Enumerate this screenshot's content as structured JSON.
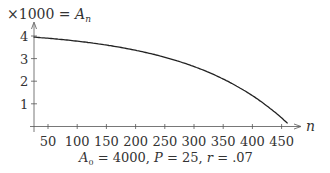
{
  "chart_data": {
    "type": "line",
    "ylabel_prefix": "×1000 = ",
    "ylabel_var": "A",
    "ylabel_sub": "n",
    "xlabel": "n",
    "caption": {
      "a0_var": "A",
      "a0_sub": "0",
      "a0_value": " = 4000, ",
      "p_var": "P",
      "p_value": " = 25, ",
      "r_var": "r",
      "r_value": " = .07"
    },
    "x_ticks": [
      "50",
      "100",
      "150",
      "200",
      "250",
      "300",
      "350",
      "400",
      "450"
    ],
    "y_ticks": [
      "1",
      "2",
      "3",
      "4"
    ],
    "xlim": [
      25,
      490
    ],
    "ylim": [
      0,
      4.6
    ],
    "grid": false,
    "series": [
      {
        "name": "A_n (thousands)",
        "x": [
          25,
          50,
          100,
          150,
          200,
          250,
          300,
          350,
          400,
          450,
          461
        ],
        "values": [
          3.955,
          3.903,
          3.774,
          3.598,
          3.371,
          3.056,
          2.65,
          2.097,
          1.361,
          0.375,
          0.1
        ]
      }
    ],
    "parameters": {
      "A0": 4000,
      "P": 25,
      "r": 0.07
    }
  }
}
